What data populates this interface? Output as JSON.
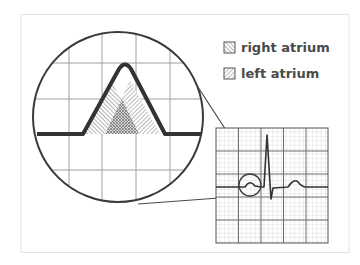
{
  "figure": {
    "colors": {
      "ink": "#3a3a3a",
      "grid": "#9a9a9a",
      "grid_minor": "#c4c4c4",
      "frame": "#e2e2e2",
      "background": "#ffffff"
    }
  },
  "legend": {
    "items": [
      {
        "label": "right atrium",
        "pattern": "dense-back-diagonal-hatch"
      },
      {
        "label": "left atrium",
        "pattern": "forward-diagonal-hatch"
      }
    ]
  },
  "magnifier": {
    "subject": "P wave",
    "components": [
      "right atrium",
      "left atrium"
    ],
    "overlap_region": "cross-hatched"
  },
  "ecg_strip": {
    "waves": [
      "P wave",
      "QRS complex",
      "T wave"
    ],
    "highlighted_wave": "P wave"
  }
}
